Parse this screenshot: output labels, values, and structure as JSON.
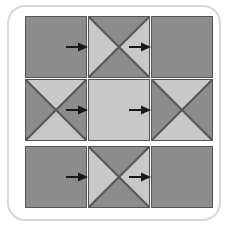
{
  "figure": {
    "name": "three-by-three-square-grid-flow-diagram",
    "frame": {
      "shape": "rounded-rectangle",
      "border_color": "#d8d8d8",
      "background": "#ffffff"
    },
    "colors": {
      "dark_gray": "#8c8c8c",
      "light_gray": "#c8c8c8",
      "stroke": "#555555",
      "arrow": "#1a1a1a",
      "frame_border": "#d8d8d8",
      "page_background": "#ffffff"
    },
    "grid": {
      "rows": 3,
      "columns": 3,
      "cell_size_px": 62
    },
    "cells": [
      {
        "id": "cell-r1c1",
        "row": 1,
        "col": 1,
        "x": 25,
        "y": 16,
        "pattern": "solid",
        "fill": "#8c8c8c",
        "triangles": {
          "top": null,
          "right": null,
          "bottom": null,
          "left": null
        }
      },
      {
        "id": "cell-r1c2",
        "row": 1,
        "col": 2,
        "x": 88,
        "y": 16,
        "pattern": "x-diagonals",
        "fill": null,
        "triangles": {
          "top": "#8c8c8c",
          "right": "#c8c8c8",
          "bottom": "#8c8c8c",
          "left": "#c8c8c8"
        }
      },
      {
        "id": "cell-r1c3",
        "row": 1,
        "col": 3,
        "x": 151,
        "y": 16,
        "pattern": "solid",
        "fill": "#8c8c8c",
        "triangles": {
          "top": null,
          "right": null,
          "bottom": null,
          "left": null
        }
      },
      {
        "id": "cell-r2c1",
        "row": 2,
        "col": 1,
        "x": 25,
        "y": 79,
        "pattern": "x-diagonals",
        "fill": null,
        "triangles": {
          "top": "#c8c8c8",
          "right": "#8c8c8c",
          "bottom": "#c8c8c8",
          "left": "#8c8c8c"
        }
      },
      {
        "id": "cell-r2c2",
        "row": 2,
        "col": 2,
        "x": 88,
        "y": 79,
        "pattern": "solid",
        "fill": "#c8c8c8",
        "triangles": {
          "top": null,
          "right": null,
          "bottom": null,
          "left": null
        }
      },
      {
        "id": "cell-r2c3",
        "row": 2,
        "col": 3,
        "x": 151,
        "y": 79,
        "pattern": "x-diagonals",
        "fill": null,
        "triangles": {
          "top": "#c8c8c8",
          "right": "#8c8c8c",
          "bottom": "#c8c8c8",
          "left": "#8c8c8c"
        }
      },
      {
        "id": "cell-r3c1",
        "row": 3,
        "col": 1,
        "x": 25,
        "y": 146,
        "pattern": "solid",
        "fill": "#8c8c8c",
        "triangles": {
          "top": null,
          "right": null,
          "bottom": null,
          "left": null
        }
      },
      {
        "id": "cell-r3c2",
        "row": 3,
        "col": 2,
        "x": 88,
        "y": 146,
        "pattern": "x-diagonals",
        "fill": null,
        "triangles": {
          "top": "#8c8c8c",
          "right": "#c8c8c8",
          "bottom": "#8c8c8c",
          "left": "#c8c8c8"
        }
      },
      {
        "id": "cell-r3c3",
        "row": 3,
        "col": 3,
        "x": 151,
        "y": 146,
        "pattern": "solid",
        "fill": "#8c8c8c",
        "triangles": {
          "top": null,
          "right": null,
          "bottom": null,
          "left": null
        }
      }
    ],
    "arrows": [
      {
        "id": "arrow-r1-c1-c2",
        "row": 1,
        "from": "cell-r1c1",
        "to": "cell-r1c2",
        "direction": "right",
        "x": 65,
        "y": 41
      },
      {
        "id": "arrow-r1-c2-c3",
        "row": 1,
        "from": "cell-r1c2",
        "to": "cell-r1c3",
        "direction": "right",
        "x": 128,
        "y": 41
      },
      {
        "id": "arrow-r2-c1-c2",
        "row": 2,
        "from": "cell-r2c1",
        "to": "cell-r2c2",
        "direction": "right",
        "x": 65,
        "y": 104
      },
      {
        "id": "arrow-r2-c2-c3",
        "row": 2,
        "from": "cell-r2c2",
        "to": "cell-r2c3",
        "direction": "right",
        "x": 128,
        "y": 104
      },
      {
        "id": "arrow-r3-c1-c2",
        "row": 3,
        "from": "cell-r3c1",
        "to": "cell-r3c2",
        "direction": "right",
        "x": 65,
        "y": 171
      },
      {
        "id": "arrow-r3-c2-c3",
        "row": 3,
        "from": "cell-r3c2",
        "to": "cell-r3c3",
        "direction": "right",
        "x": 128,
        "y": 171
      }
    ]
  }
}
